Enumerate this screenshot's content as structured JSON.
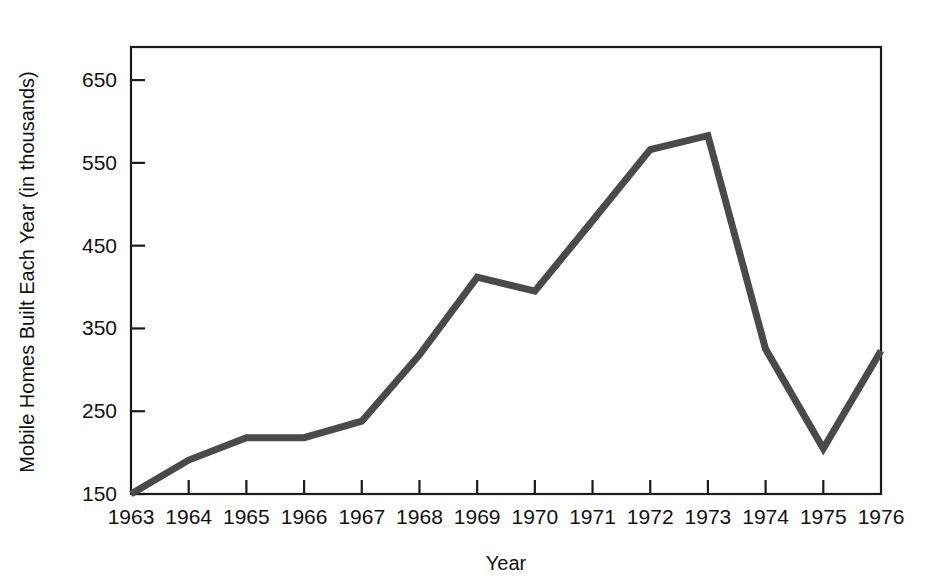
{
  "chart_data": {
    "type": "line",
    "title": "",
    "xlabel": "Year",
    "ylabel": "Mobile Homes Built Each Year (in thousands)",
    "categories": [
      1963,
      1964,
      1965,
      1966,
      1967,
      1968,
      1969,
      1970,
      1971,
      1972,
      1973,
      1974,
      1975,
      1976
    ],
    "x_tick_labels": [
      "1963",
      "1964",
      "1965",
      "1966",
      "1967",
      "1968",
      "1969",
      "1970",
      "1971",
      "1972",
      "1973",
      "1974",
      "1975",
      "1976"
    ],
    "values": [
      150,
      191,
      218,
      218,
      238,
      318,
      412,
      395,
      480,
      566,
      583,
      325,
      205,
      323
    ],
    "y_tick_labels": [
      "150",
      "250",
      "350",
      "450",
      "550",
      "650"
    ],
    "y_ticks": [
      150,
      250,
      350,
      450,
      550,
      650
    ],
    "ylim": [
      150,
      690
    ],
    "xlim": [
      1963,
      1976
    ],
    "grid": false,
    "legend": false,
    "series_name": "Mobile Homes Built Each Year"
  },
  "style": {
    "line_color": "#4a4a4a",
    "line_width": 7,
    "axis_color": "#1a1a1a",
    "background": "#ffffff",
    "text_color": "#111111"
  },
  "labels": {
    "x_axis_title": "Year",
    "y_axis_title": "Mobile Homes Built Each Year (in thousands)"
  }
}
